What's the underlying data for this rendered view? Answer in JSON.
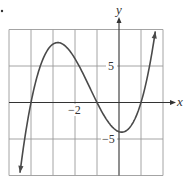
{
  "chart_data": {
    "type": "line",
    "title": "",
    "xlabel": "x",
    "ylabel": "y",
    "xlim": [
      -5,
      2
    ],
    "ylim": [
      -10,
      10
    ],
    "grid": true,
    "x_grid_step": 1,
    "y_grid_step": 5,
    "tick_labels": {
      "x": [
        {
          "value": -2,
          "label": "−2"
        }
      ],
      "y": [
        {
          "value": 5,
          "label": "5"
        },
        {
          "value": -5,
          "label": "−5"
        }
      ]
    },
    "series": [
      {
        "name": "f(x)",
        "arrows_both_ends": true,
        "x": [
          -4.5,
          -4.25,
          -4.0,
          -3.75,
          -3.5,
          -3.25,
          -3.0,
          -2.75,
          -2.5,
          -2.25,
          -2.0,
          -1.75,
          -1.5,
          -1.25,
          -1.0,
          -0.75,
          -0.5,
          -0.25,
          0.0,
          0.25,
          0.5,
          0.75,
          1.0,
          1.25,
          1.5,
          1.65
        ],
        "y": [
          -9.63,
          -4.45,
          0.0,
          3.24,
          5.63,
          7.22,
          8.0,
          8.2,
          7.88,
          7.08,
          6.0,
          4.73,
          3.13,
          1.55,
          0.0,
          -1.42,
          -2.63,
          -3.52,
          -4.0,
          -4.0,
          -3.38,
          -2.08,
          0.0,
          2.95,
          6.88,
          9.68
        ]
      }
    ],
    "key_points": {
      "x_intercepts": [
        -4,
        -1,
        1
      ],
      "y_intercept": -4,
      "local_max": [
        -2.79,
        8.2
      ],
      "local_min": [
        0.12,
        -4.06
      ]
    }
  },
  "labels": {
    "x_axis": "x",
    "y_axis": "y",
    "x_tick_neg2": "−2",
    "y_tick_5": "5",
    "y_tick_neg5": "−5"
  },
  "colors": {
    "grid": "#9a9a9a",
    "axis": "#333333",
    "curve": "#4a4a4a"
  }
}
